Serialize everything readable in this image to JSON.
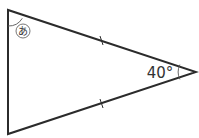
{
  "diagram": {
    "type": "isosceles-triangle",
    "vertices": {
      "top_left": [
        8,
        10
      ],
      "bottom_left": [
        8,
        134
      ],
      "right": [
        196,
        72
      ]
    },
    "angle_label_apex": "40°",
    "unknown_angle_label": "あ",
    "equal_side_marks": 2,
    "stroke_color": "#2b2b2b"
  }
}
